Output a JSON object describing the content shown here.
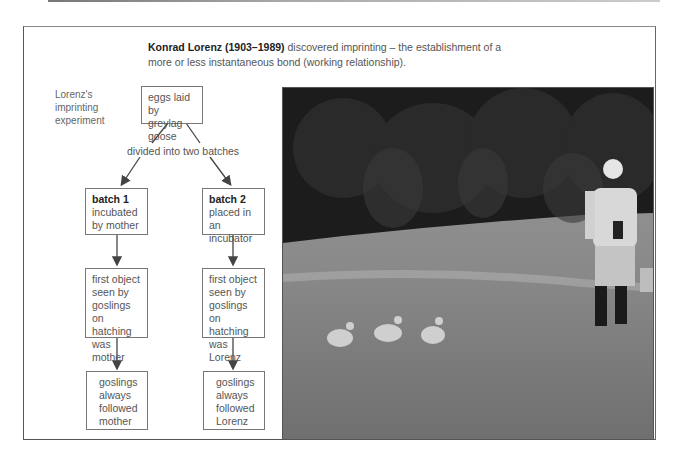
{
  "headline": {
    "bold": "Konrad Lorenz (1903–1989)",
    "rest": " discovered imprinting – the establishment of a more or less instantaneous bond (working relationship)."
  },
  "diagram": {
    "side_label": "Lorenz's imprinting experiment",
    "root": "eggs laid by greylag goose",
    "split_label": "divided into two batches",
    "batch1": {
      "title": "batch 1",
      "desc": "incubated by mother",
      "seen": "first object seen by goslings on hatching was mother",
      "result": "goslings always followed mother"
    },
    "batch2": {
      "title": "batch 2",
      "desc": "placed in an incubator",
      "seen": "first object seen by goslings on hatching was Lorenz",
      "result": "goslings always followed Lorenz"
    }
  },
  "photo": {
    "description": "Black-and-white photo of Konrad Lorenz walking across a meadow, followed by three goslings, forest in background"
  }
}
